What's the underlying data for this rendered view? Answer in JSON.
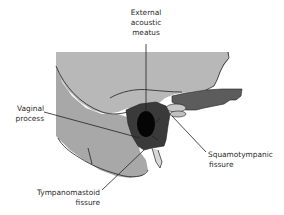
{
  "diagram": {
    "labels": {
      "external_acoustic_meatus": [
        "External",
        "acoustic",
        "meatus"
      ],
      "vaginal_process": [
        "Vaginal",
        "process"
      ],
      "squamotympanic_fissure": [
        "Squamotympanic",
        "fissure"
      ],
      "tympanomastoid_fissure": [
        "Tympanomastoid",
        "fissure"
      ]
    },
    "colors": {
      "bone_light": "#b4b4b4",
      "bone_mid": "#a9a9a9",
      "tympanic_dark": "#3a3a3a",
      "meatus": "#050505",
      "zygomatic": "#5a5a5a",
      "outline": "#222222"
    }
  }
}
